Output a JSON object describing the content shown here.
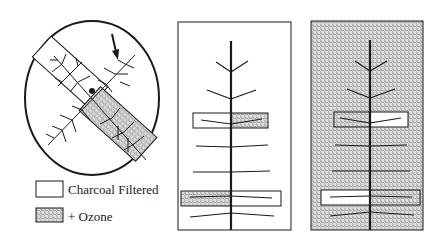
{
  "legend": {
    "items": [
      {
        "label": "Charcoal Filtered",
        "swatch": "white"
      },
      {
        "label": "+ Ozone",
        "swatch": "stippled"
      }
    ]
  },
  "panels": {
    "circle": {
      "description": "Top view of plant with two branches enclosed: one charcoal filtered, one ozone"
    },
    "middle": {
      "background": "white",
      "upper_box": {
        "left": "white",
        "right": "stippled"
      },
      "lower_box": {
        "left": "stippled",
        "right": "white"
      }
    },
    "right": {
      "background": "stippled",
      "upper_box": {
        "left": "stippled",
        "right": "white"
      },
      "lower_box": {
        "left": "white",
        "right": "stippled"
      }
    }
  },
  "colors": {
    "line": "#1a1a1a",
    "stipple_bg": "#d6d6d6",
    "stipple_dot": "#5a5a5a"
  }
}
